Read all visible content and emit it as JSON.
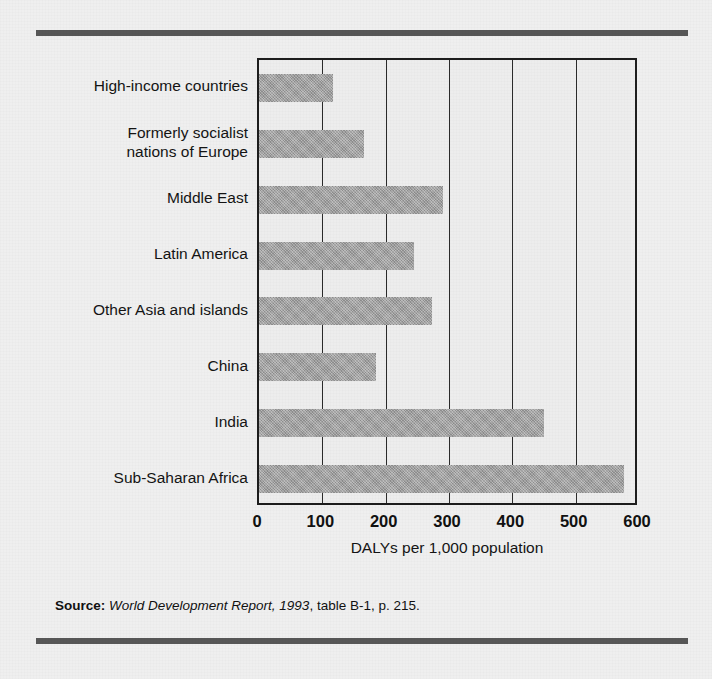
{
  "chart_data": {
    "type": "bar",
    "orientation": "horizontal",
    "title": "",
    "xlabel": "DALYs per 1,000 population",
    "ylabel": "",
    "xlim": [
      0,
      600
    ],
    "xticks": [
      0,
      100,
      200,
      300,
      400,
      500,
      600
    ],
    "xtick_labels": [
      "0",
      "100",
      "200",
      "300",
      "400",
      "500",
      "600"
    ],
    "grid": "vertical",
    "legend": "none",
    "categories": [
      "High-income countries",
      "Formerly socialist\nnations of Europe",
      "Middle East",
      "Latin America",
      "Other Asia and islands",
      "China",
      "India",
      "Sub-Saharan Africa"
    ],
    "category_labels": [
      [
        "High-income countries"
      ],
      [
        "Formerly socialist",
        "nations of Europe"
      ],
      [
        "Middle East"
      ],
      [
        "Latin America"
      ],
      [
        "Other Asia and islands"
      ],
      [
        "China"
      ],
      [
        "India"
      ],
      [
        "Sub-Saharan Africa"
      ]
    ],
    "values": [
      117,
      166,
      291,
      245,
      273,
      185,
      450,
      577
    ],
    "bar_color": "#9b9b9b",
    "axis_color": "#1d1d1d",
    "background_color": "#efefef"
  },
  "source": {
    "label": "Source:",
    "title": "World Development Report, 1993",
    "rest": ", table B-1, p. 215."
  }
}
